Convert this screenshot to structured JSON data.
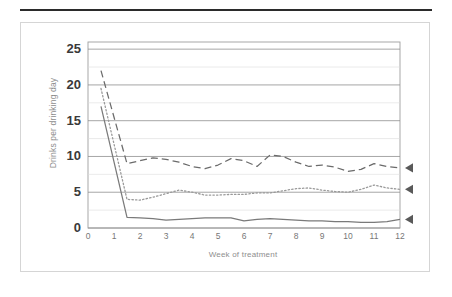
{
  "figure": {
    "has_top_rule": true,
    "frame_color": "#d5d5d5",
    "background": "#ffffff"
  },
  "chart_data": {
    "type": "line",
    "title": "",
    "xlabel": "Week of treatment",
    "ylabel": "Drinks per drinking day",
    "xlim": [
      0,
      12
    ],
    "ylim": [
      0,
      26
    ],
    "xticks": [
      0,
      1,
      2,
      3,
      4,
      5,
      6,
      7,
      8,
      9,
      10,
      11,
      12
    ],
    "xticklabels": [
      "0",
      "1",
      "2",
      "3",
      "4",
      "5",
      "6",
      "7",
      "8",
      "9",
      "10",
      "11",
      "12"
    ],
    "yticks": [
      0,
      5,
      10,
      15,
      20,
      25
    ],
    "yticklabels": [
      "0",
      "5",
      "10",
      "15",
      "20",
      "25"
    ],
    "gridlines_y": [
      0,
      2.5,
      5,
      7.5,
      10,
      12.5,
      15,
      17.5,
      20,
      22.5,
      25
    ],
    "grid": true,
    "grid_axis": "y",
    "legend": "none",
    "x": [
      0.5,
      1.5,
      2.0,
      2.5,
      3.0,
      3.5,
      4.0,
      4.5,
      5.0,
      5.5,
      6.0,
      6.5,
      7.0,
      7.5,
      8.0,
      8.5,
      9.0,
      9.5,
      10.0,
      10.5,
      11.0,
      11.5,
      12.0
    ],
    "series": [
      {
        "name": "High-drinking group",
        "style": "dashed",
        "color": "#6b6b6b",
        "end_marker": "left-triangle",
        "values": [
          22.0,
          9.0,
          9.4,
          9.8,
          9.6,
          9.2,
          8.6,
          8.3,
          8.8,
          9.7,
          9.4,
          8.6,
          10.2,
          10.0,
          9.2,
          8.6,
          8.8,
          8.5,
          7.9,
          8.2,
          9.0,
          8.6,
          8.4
        ]
      },
      {
        "name": "Moderate-drinking group",
        "style": "dotted",
        "color": "#9a9a9a",
        "end_marker": "left-triangle",
        "values": [
          19.5,
          4.0,
          3.9,
          4.3,
          4.8,
          5.3,
          5.0,
          4.6,
          4.6,
          4.7,
          4.7,
          4.9,
          4.9,
          5.2,
          5.5,
          5.6,
          5.3,
          5.1,
          5.0,
          5.4,
          6.0,
          5.6,
          5.4
        ]
      },
      {
        "name": "Low-drinking group",
        "style": "solid",
        "color": "#7a7a7a",
        "end_marker": "left-triangle",
        "values": [
          17.0,
          1.5,
          1.4,
          1.3,
          1.1,
          1.2,
          1.3,
          1.4,
          1.4,
          1.4,
          1.0,
          1.2,
          1.3,
          1.2,
          1.1,
          1.0,
          1.0,
          0.9,
          0.9,
          0.8,
          0.8,
          0.9,
          1.2
        ]
      }
    ]
  }
}
